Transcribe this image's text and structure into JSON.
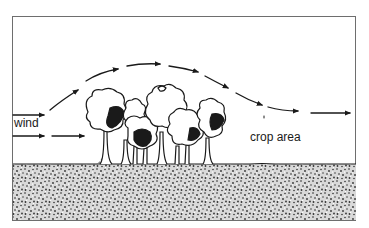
{
  "diagram": {
    "type": "windbreak airflow illustration",
    "labels": {
      "wind": "wind",
      "crop_area": "crop area"
    },
    "elements": {
      "windbreak": "row of trees",
      "ground": "stippled soil",
      "airflow": "dashed arrows rising over trees and descending onto crop area"
    },
    "colors": {
      "ink": "#1a1a1a",
      "background": "#ffffff",
      "frame": "#6e6e6e"
    }
  }
}
